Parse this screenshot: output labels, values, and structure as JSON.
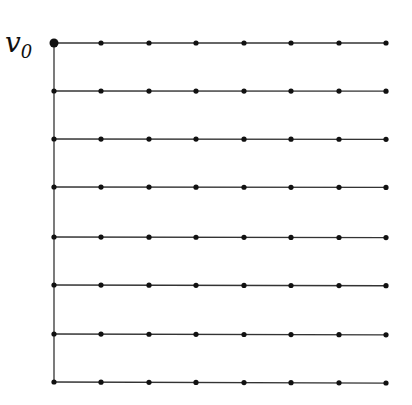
{
  "diagram": {
    "type": "comb-graph",
    "root_label": "v",
    "root_subscript": "0",
    "rows": 8,
    "cols": 8,
    "x_positions": [
      54,
      101,
      149,
      196,
      244,
      291,
      339,
      386
    ],
    "y_positions": [
      43,
      91,
      139,
      187,
      237,
      285,
      334,
      382
    ],
    "edge_color": "#333333",
    "node_color": "#111111",
    "node_radius": 2.6,
    "root_radius": 4.5
  }
}
